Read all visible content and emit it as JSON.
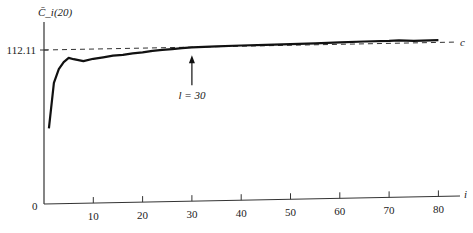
{
  "chart_data": {
    "type": "line",
    "title": "",
    "ylabel": "C̄_i(20)",
    "xlabel": "i",
    "origin_label": "0",
    "xlim": [
      0,
      87
    ],
    "ylim": [
      0,
      112.11
    ],
    "xticks": [
      10,
      20,
      30,
      40,
      50,
      60,
      70,
      80
    ],
    "xtick_labels": [
      "10",
      "20",
      "30",
      "40",
      "50",
      "60",
      "70",
      "80"
    ],
    "ytick_labels": [
      "112.11"
    ],
    "reference_line": {
      "value": 112.11,
      "label": "c",
      "style": "dashed"
    },
    "annotation": {
      "text": "l = 30",
      "x": 30,
      "arrow": "up"
    },
    "series": [
      {
        "name": "C̄_i(20)",
        "x": [
          1,
          2,
          3,
          4,
          5,
          6,
          8,
          10,
          12,
          14,
          16,
          18,
          20,
          22,
          24,
          26,
          28,
          30,
          35,
          40,
          45,
          50,
          55,
          60,
          65,
          70,
          72,
          75,
          80
        ],
        "y": [
          55,
          88,
          98,
          103,
          106,
          105,
          103.5,
          105,
          106,
          107,
          107.5,
          108.5,
          109,
          110,
          110.5,
          111,
          111.5,
          112,
          112.3,
          112.6,
          112.7,
          112.9,
          113.2,
          113.5,
          113.8,
          114,
          114.2,
          113.6,
          113.8
        ]
      }
    ]
  }
}
